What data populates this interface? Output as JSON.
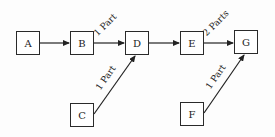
{
  "diagram": {
    "nodes": [
      {
        "id": "A",
        "label": "A",
        "x": 16,
        "y": 31
      },
      {
        "id": "B",
        "label": "B",
        "x": 70,
        "y": 31
      },
      {
        "id": "D",
        "label": "D",
        "x": 125,
        "y": 31
      },
      {
        "id": "E",
        "label": "E",
        "x": 180,
        "y": 31
      },
      {
        "id": "G",
        "label": "G",
        "x": 234,
        "y": 30
      },
      {
        "id": "C",
        "label": "C",
        "x": 70,
        "y": 103
      },
      {
        "id": "F",
        "label": "F",
        "x": 180,
        "y": 102
      }
    ],
    "edges": [
      {
        "from": "A",
        "to": "B",
        "label": ""
      },
      {
        "from": "B",
        "to": "D",
        "label": "1 Part"
      },
      {
        "from": "C",
        "to": "D",
        "label": "1 Part"
      },
      {
        "from": "D",
        "to": "E",
        "label": ""
      },
      {
        "from": "E",
        "to": "G",
        "label": "2 Parts"
      },
      {
        "from": "F",
        "to": "G",
        "label": "1 Part"
      }
    ]
  }
}
